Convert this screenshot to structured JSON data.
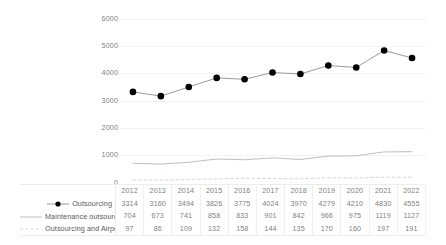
{
  "chart_data": {
    "type": "line",
    "title": "",
    "xlabel": "",
    "ylabel": "",
    "ylim": [
      0,
      6000
    ],
    "grid": true,
    "legend_position": "table-left",
    "categories": [
      "2012",
      "2013",
      "2014",
      "2015",
      "2016",
      "2017",
      "2018",
      "2019",
      "2020",
      "2021",
      "2022"
    ],
    "yticks": [
      "0",
      "1000",
      "2000",
      "3000",
      "4000",
      "5000",
      "6000"
    ],
    "series": [
      {
        "name": "Outsourcing",
        "marker": "filled-circle",
        "line_style": "solid",
        "color": "#000000",
        "values": [
          3314,
          3160,
          3494,
          3826,
          3775,
          4024,
          3970,
          4279,
          4210,
          4830,
          4555
        ]
      },
      {
        "name": "Maintenance outsourcing",
        "marker": "none",
        "line_style": "solid",
        "color": "#bfbfbf",
        "values": [
          704,
          673,
          741,
          858,
          833,
          901,
          842,
          966,
          975,
          1119,
          1127
        ]
      },
      {
        "name": "Outsourcing and Airports",
        "marker": "none",
        "line_style": "dashed",
        "color": "#d9d9d9",
        "values": [
          97,
          86,
          109,
          132,
          158,
          144,
          135,
          170,
          160,
          197,
          191
        ]
      }
    ]
  },
  "colors": {
    "primary_series": "#000000",
    "secondary_series": "#bfbfbf",
    "tertiary_series": "#d9d9d9",
    "gridline": "#f2f2f2",
    "text": "#7f7f7f"
  }
}
